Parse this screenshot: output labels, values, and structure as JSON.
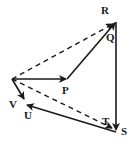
{
  "diagram": {
    "type": "vector-polygon",
    "labels": {
      "R": "R",
      "Q": "Q",
      "P": "P",
      "V": "V",
      "U": "U",
      "T": "T",
      "S": "S"
    },
    "points": {
      "origin": [
        12,
        79
      ],
      "P": [
        67,
        79
      ],
      "R": [
        116,
        22
      ],
      "S": [
        116,
        131
      ],
      "U": [
        26,
        105
      ],
      "V": [
        24,
        99
      ],
      "T": [
        110,
        127
      ]
    },
    "vectors_solid": [
      "origin->P",
      "P->R",
      "R->S",
      "S->U",
      "origin->V"
    ],
    "vectors_dashed": [
      "origin->R",
      "origin->T"
    ],
    "stroke_color": "#1a1a1a"
  }
}
